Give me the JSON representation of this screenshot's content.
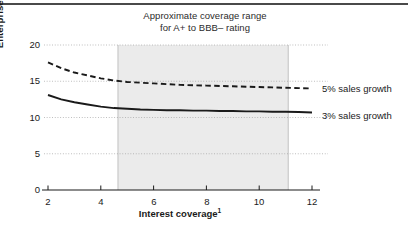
{
  "chart_data": {
    "type": "line",
    "title": "Approximate coverage range for A+ to BBB– rating",
    "title_line1": "Approximate coverage range",
    "title_line2": "for A+ to BBB– rating",
    "xlabel": "Interest coverage",
    "xlabel_superscript": "1",
    "ylabel": "Enterprise value/EBITA",
    "xlim": [
      2,
      12
    ],
    "ylim": [
      0,
      20
    ],
    "xticks": [
      "2",
      "4",
      "6",
      "8",
      "10",
      "12"
    ],
    "xtick_values": [
      2,
      4,
      6,
      8,
      10,
      12
    ],
    "yticks": [
      "0",
      "5",
      "10",
      "15",
      "20"
    ],
    "ytick_values": [
      0,
      5,
      10,
      15,
      20
    ],
    "grid": "horizontal-dotted",
    "legend_position": "right-of-plot",
    "shaded_band": {
      "label": "Approximate coverage range for A+ to BBB– rating",
      "x_start": 4.65,
      "x_end": 11.1,
      "color": "#ebebeb",
      "border_color": "#b4b4b4"
    },
    "series": [
      {
        "name": "5% sales growth",
        "style": "dashed",
        "color": "#1a1a1a",
        "x": [
          2,
          2.5,
          3,
          3.5,
          4,
          4.5,
          5,
          5.5,
          6,
          6.5,
          7,
          7.5,
          8,
          8.5,
          9,
          9.5,
          10,
          10.5,
          11,
          11.5,
          12
        ],
        "y": [
          17.6,
          16.8,
          16.2,
          15.8,
          15.4,
          15.1,
          14.9,
          14.8,
          14.7,
          14.6,
          14.5,
          14.45,
          14.4,
          14.35,
          14.3,
          14.25,
          14.2,
          14.15,
          14.1,
          14.05,
          14.0
        ]
      },
      {
        "name": "3% sales growth",
        "style": "solid",
        "color": "#1a1a1a",
        "x": [
          2,
          2.5,
          3,
          3.5,
          4,
          4.5,
          5,
          5.5,
          6,
          6.5,
          7,
          7.5,
          8,
          8.5,
          9,
          9.5,
          10,
          10.5,
          11,
          11.5,
          12
        ],
        "y": [
          13.1,
          12.5,
          12.1,
          11.8,
          11.5,
          11.3,
          11.2,
          11.1,
          11.05,
          11.0,
          11.0,
          10.95,
          10.95,
          10.9,
          10.9,
          10.85,
          10.85,
          10.8,
          10.8,
          10.75,
          10.7
        ]
      }
    ]
  },
  "legend": {
    "items": [
      {
        "label": "5% sales growth"
      },
      {
        "label": "3% sales growth"
      }
    ]
  },
  "axes": {
    "y_title": "Enterprise value/EBITA",
    "x_title": "Interest coverage",
    "x_title_sup": "1"
  }
}
